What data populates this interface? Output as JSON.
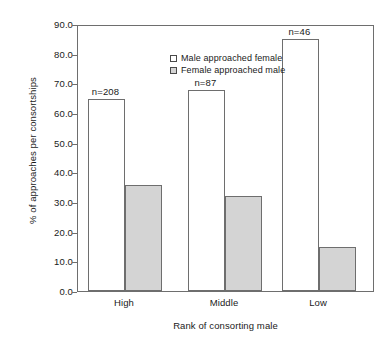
{
  "chart_data": {
    "type": "bar",
    "title": "",
    "xlabel": "Rank of consorting male",
    "ylabel": "% of approaches per consortships",
    "categories": [
      "High",
      "Middle",
      "Low"
    ],
    "series": [
      {
        "name": "Male approached female",
        "values": [
          64.7,
          67.7,
          84.9
        ],
        "style": "open"
      },
      {
        "name": "Female approached male",
        "values": [
          35.7,
          32.0,
          14.8
        ],
        "style": "filled"
      }
    ],
    "annotations": [
      "n=208",
      "n=87",
      "n=46"
    ],
    "ylim": [
      0.0,
      90.0
    ],
    "ytick_labels": [
      "90.0",
      "80.0",
      "70.0",
      "60.0",
      "50.0",
      "40.0",
      "30.0",
      "20.0",
      "10.0",
      "0.0"
    ],
    "ytick_values": [
      90.0,
      80.0,
      70.0,
      60.0,
      50.0,
      40.0,
      30.0,
      20.0,
      10.0,
      0.0
    ],
    "grid": false,
    "legend_position": "top-left",
    "colors": {
      "open_bar": "#ffffff",
      "filled_bar": "#d4d4d4",
      "axis": "#6e6e6e",
      "text": "#1a1a1a"
    }
  }
}
